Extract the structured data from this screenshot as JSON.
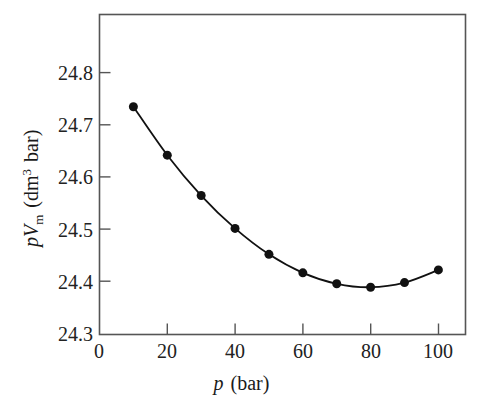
{
  "chart_data": {
    "type": "line",
    "title": "",
    "subtitle": "",
    "xlabel_parts": {
      "symbol": "p",
      "unit_open": "(",
      "unit": "bar",
      "unit_close": ")"
    },
    "ylabel_parts": {
      "symbol_p": "p",
      "symbol_v": "V",
      "symbol_v_sub": "m",
      "unit_open": "(",
      "unit_dm": "dm",
      "unit_exp": "3",
      "unit_bar": "bar",
      "unit_close": ")"
    },
    "xlabel": "p (bar)",
    "ylabel": "pVm (dm3 bar)",
    "x": [
      10,
      20,
      30,
      40,
      50,
      60,
      70,
      80,
      90,
      100
    ],
    "values": [
      24.695,
      24.611,
      24.541,
      24.484,
      24.439,
      24.407,
      24.388,
      24.382,
      24.39,
      24.412
    ],
    "xlim": [
      0,
      108
    ],
    "ylim": [
      24.3,
      24.855
    ],
    "xticks": [
      0,
      20,
      40,
      60,
      80,
      100
    ],
    "xtick_labels": [
      "0",
      "20",
      "40",
      "60",
      "80",
      "100"
    ],
    "yticks": [
      24.3,
      24.4,
      24.5,
      24.6,
      24.7,
      24.8
    ],
    "ytick_labels": [
      "24.3",
      "24.4",
      "24.5",
      "24.6",
      "24.7",
      "24.8"
    ],
    "grid": false,
    "legend": "none",
    "series_color": "#111111",
    "marker": "filled-circle",
    "marker_size": 9,
    "line_width": 1.8,
    "frame_color": "#555555",
    "background": "#ffffff"
  }
}
